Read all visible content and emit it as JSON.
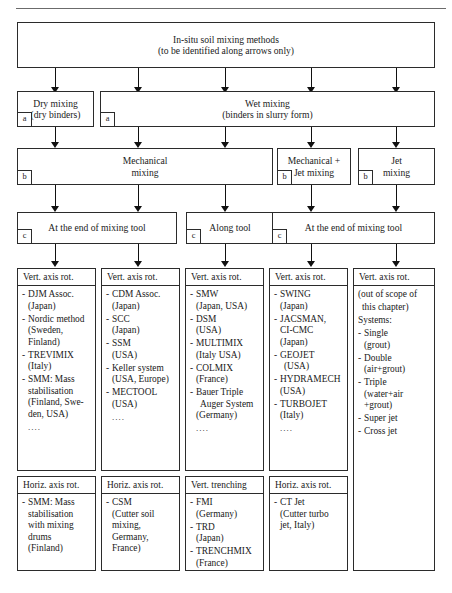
{
  "root": {
    "lines": [
      "In-situ soil mixing methods",
      "(to be identified along arrows only)"
    ]
  },
  "level_a": [
    {
      "tag": "a",
      "lines": [
        "Dry mixing",
        "(dry binders)"
      ]
    },
    {
      "tag": "a",
      "lines": [
        "Wet mixing",
        "(binders in slurry form)"
      ]
    }
  ],
  "level_b": [
    {
      "tag": "b",
      "lines": [
        "Mechanical",
        "mixing"
      ]
    },
    {
      "tag": "b",
      "lines": [
        "Mechanical +",
        "Jet mixing"
      ]
    },
    {
      "tag": "b",
      "lines": [
        "Jet",
        "mixing"
      ]
    }
  ],
  "level_c": [
    {
      "tag": "c",
      "lines": [
        "At the end of mixing tool"
      ]
    },
    {
      "tag": "c",
      "lines": [
        "Along tool"
      ]
    },
    {
      "tag": "c",
      "lines": [
        "At the end of mixing tool"
      ]
    }
  ],
  "columns": [
    {
      "top": {
        "header": "Vert. axis rot.",
        "items": [
          {
            "dash": "-",
            "lines": [
              "DJM Assoc.",
              "(Japan)"
            ]
          },
          {
            "dash": "-",
            "lines": [
              "Nordic method",
              "(Sweden,",
              "Finland)"
            ]
          },
          {
            "dash": "-",
            "lines": [
              "TREVIMIX",
              "(Italy)"
            ]
          },
          {
            "dash": "-",
            "lines": [
              "SMM: Mass",
              "stabilisation",
              "(Finland, Swe-",
              "den, USA)"
            ]
          },
          {
            "dash": "",
            "lines": [
              "...."
            ]
          }
        ]
      },
      "bottom": {
        "header": "Horiz. axis rot.",
        "items": [
          {
            "dash": "-",
            "lines": [
              "SMM: Mass",
              "stabilisation",
              "with mixing",
              "drums",
              "(Finland)"
            ]
          }
        ]
      }
    },
    {
      "top": {
        "header": "Vert. axis rot.",
        "items": [
          {
            "dash": "-",
            "lines": [
              "CDM Assoc.",
              "(Japan)"
            ]
          },
          {
            "dash": "-",
            "lines": [
              "SCC",
              "(Japan)"
            ]
          },
          {
            "dash": "-",
            "lines": [
              "SSM",
              "(USA)"
            ]
          },
          {
            "dash": "-",
            "lines": [
              "Keller system",
              "(USA, Europe)"
            ]
          },
          {
            "dash": "-",
            "lines": [
              "MECTOOL",
              "(USA)"
            ]
          },
          {
            "dash": "",
            "lines": [
              "...."
            ]
          }
        ]
      },
      "bottom": {
        "header": "Horiz. axis rot.",
        "items": [
          {
            "dash": "-",
            "lines": [
              "CSM",
              "(Cutter soil",
              "mixing,",
              "Germany,",
              "France)"
            ]
          }
        ]
      }
    },
    {
      "top": {
        "header": "Vert. axis rot.",
        "items": [
          {
            "dash": "-",
            "lines": [
              "SMW",
              "(Japan, USA)"
            ]
          },
          {
            "dash": "-",
            "lines": [
              "DSM",
              "(USA)"
            ]
          },
          {
            "dash": "-",
            "lines": [
              "MULTIMIX",
              "(Italy USA)"
            ]
          },
          {
            "dash": "-",
            "lines": [
              "COLMIX",
              "(France)"
            ]
          },
          {
            "dash": "-",
            "lines": [
              "Bauer Triple",
              "Auger System",
              "(Germany)"
            ]
          },
          {
            "dash": "",
            "lines": [
              "...."
            ]
          }
        ]
      },
      "bottom": {
        "header": "Vert. trenching",
        "items": [
          {
            "dash": "-",
            "lines": [
              "FMI",
              "(Germany)"
            ]
          },
          {
            "dash": "-",
            "lines": [
              "TRD",
              "(Japan)"
            ]
          },
          {
            "dash": "-",
            "lines": [
              "TRENCHMIX",
              "(France)"
            ]
          }
        ]
      }
    },
    {
      "top": {
        "header": "Vert. axis rot.",
        "items": [
          {
            "dash": "-",
            "lines": [
              "SWING",
              "(Japan)"
            ]
          },
          {
            "dash": "-",
            "lines": [
              "JACSMAN,",
              "CI-CMC",
              "(Japan)"
            ]
          },
          {
            "dash": "-",
            "lines": [
              "GEOJET",
              "(USA)"
            ]
          },
          {
            "dash": "-",
            "lines": [
              "HYDRAMECH",
              "(USA)"
            ]
          },
          {
            "dash": "-",
            "lines": [
              "TURBOJET",
              "(Italy)"
            ]
          },
          {
            "dash": "",
            "lines": [
              "...."
            ]
          }
        ]
      },
      "bottom": {
        "header": "Horiz. axis rot.",
        "items": [
          {
            "dash": "-",
            "lines": [
              "CT Jet",
              "(Cutter turbo",
              "jet, Italy)"
            ]
          }
        ]
      }
    },
    {
      "top": {
        "header": "Vert. axis rot.",
        "preamble": [
          "(out of scope of",
          "this chapter)",
          "Systems:"
        ],
        "items": [
          {
            "dash": "-",
            "lines": [
              "Single",
              "(grout)"
            ]
          },
          {
            "dash": "-",
            "lines": [
              "Double",
              "(air+grout)"
            ]
          },
          {
            "dash": "-",
            "lines": [
              "Triple",
              "(water+air",
              "+grout)"
            ]
          },
          {
            "dash": "-",
            "lines": [
              "Super jet"
            ]
          },
          {
            "dash": "-",
            "lines": [
              "Cross jet"
            ]
          }
        ]
      }
    }
  ]
}
